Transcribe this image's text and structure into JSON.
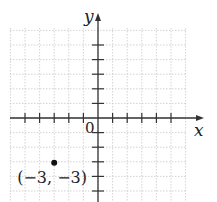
{
  "chart_data": {
    "type": "scatter",
    "title": "",
    "xlabel": "x",
    "ylabel": "y",
    "origin_label": "0",
    "xlim": [
      -6,
      6
    ],
    "ylim": [
      -6,
      6
    ],
    "grid": true,
    "x_ticks": [
      -5,
      -4,
      -3,
      -2,
      -1,
      1,
      2,
      3,
      4,
      5
    ],
    "y_ticks": [
      -5,
      -4,
      -3,
      -2,
      -1,
      1,
      2,
      3,
      4,
      5
    ],
    "points": [
      {
        "x": -3,
        "y": -3,
        "label": "(−3, −3)"
      }
    ]
  },
  "colors": {
    "axis": "#333333",
    "grid": "#c8c8c8",
    "point": "#111111"
  }
}
